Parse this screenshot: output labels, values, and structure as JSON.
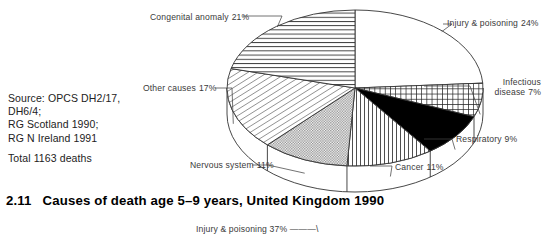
{
  "figure": {
    "caption_number": "2.11",
    "caption_text": "Causes of death age 5–9 years, United Kingdom 1990",
    "source_lines": [
      "Source: OPCS DH2/17,",
      "DH6/4;",
      "RG Scotland 1990;",
      "RG N Ireland 1991"
    ],
    "total_line": "Total 1163 deaths"
  },
  "next_figure": {
    "teaser_label": "Injury & poisoning",
    "teaser_value": "37%"
  },
  "labels": {
    "congenital": {
      "name": "Congenital anomaly",
      "pct": "21%"
    },
    "injury": {
      "name": "Injury & poisoning",
      "pct": "24%"
    },
    "infectious": {
      "line1": "Infectious",
      "line2": "disease",
      "pct": "7%"
    },
    "respiratory": {
      "name": "Respiratory",
      "pct": "9%"
    },
    "cancer": {
      "name": "Cancer",
      "pct": "11%"
    },
    "nervous": {
      "name": "Nervous system",
      "pct": "11%"
    },
    "other": {
      "name": "Other causes",
      "pct": "17%"
    }
  },
  "chart_data": {
    "type": "pie",
    "title": "Causes of death age 5–9 years, United Kingdom 1990",
    "subtitle": "Total 1163 deaths",
    "unit": "percent",
    "total_deaths": 1163,
    "start_angle_deg": 0,
    "direction": "clockwise",
    "three_d": true,
    "legend": "callout-labels",
    "categories": [
      "Injury & poisoning",
      "Infectious disease",
      "Respiratory",
      "Cancer",
      "Nervous system",
      "Other causes",
      "Congenital anomaly"
    ],
    "values": [
      24,
      7,
      9,
      11,
      11,
      17,
      21
    ],
    "slices": [
      {
        "label": "Injury & poisoning",
        "value": 24,
        "fill": "white",
        "pattern": "none"
      },
      {
        "label": "Infectious disease",
        "value": 7,
        "fill": "grid",
        "pattern": "cross-hatch"
      },
      {
        "label": "Respiratory",
        "value": 9,
        "fill": "solid-black",
        "pattern": "solid"
      },
      {
        "label": "Cancer",
        "value": 11,
        "fill": "vertical",
        "pattern": "vertical-lines"
      },
      {
        "label": "Nervous system",
        "value": 11,
        "fill": "checker",
        "pattern": "fine-checker"
      },
      {
        "label": "Other causes",
        "value": 17,
        "fill": "diagonal",
        "pattern": "diagonal-hatch"
      },
      {
        "label": "Congenital anomaly",
        "value": 21,
        "fill": "horizontal",
        "pattern": "horizontal-lines"
      }
    ]
  },
  "colors": {
    "ink": "#1a1a1a",
    "label_ink": "#3a3a3a",
    "stroke": "#444444",
    "page": "#ffffff",
    "slice_black": "#000000"
  }
}
